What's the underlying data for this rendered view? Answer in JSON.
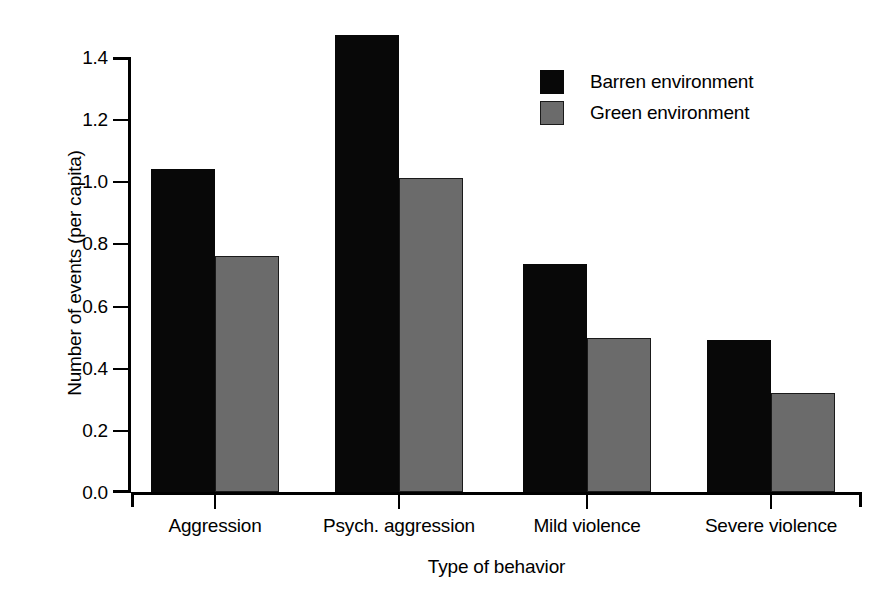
{
  "chart_data": {
    "type": "bar",
    "title": "",
    "subtitle": "",
    "xlabel": "Type of behavior",
    "ylabel": "Number of events (per capita)",
    "categories": [
      "Aggression",
      "Psych. aggression",
      "Mild violence",
      "Severe violence"
    ],
    "series": [
      {
        "name": "Barren environment",
        "color": "#080808",
        "values": [
          1.04,
          1.47,
          0.735,
          0.49
        ]
      },
      {
        "name": "Green environment",
        "color": "#6b6b6b",
        "values": [
          0.76,
          1.01,
          0.495,
          0.32
        ]
      }
    ],
    "ylim": [
      0.0,
      1.5
    ],
    "y_ticks": [
      0.0,
      0.2,
      0.4,
      0.6,
      0.8,
      1.0,
      1.2,
      1.4
    ],
    "y_tick_labels": [
      "0.0",
      "0.2",
      "0.4",
      "0.6",
      "0.8",
      "1.0",
      "1.2",
      "1.4"
    ],
    "grid": false,
    "legend_position": "top-right",
    "legend_entries": [
      "Barren environment",
      "Green environment"
    ],
    "grouping": "grouped",
    "bar_order": [
      "barren",
      "green"
    ]
  },
  "axes": {
    "y_title": "Number of events (per capita)",
    "x_title": "Type of behavior"
  },
  "legend": {
    "items": [
      {
        "label": "Barren environment",
        "swatch": "black-square-swatch"
      },
      {
        "label": "Green environment",
        "swatch": "gray-square-swatch"
      }
    ]
  }
}
